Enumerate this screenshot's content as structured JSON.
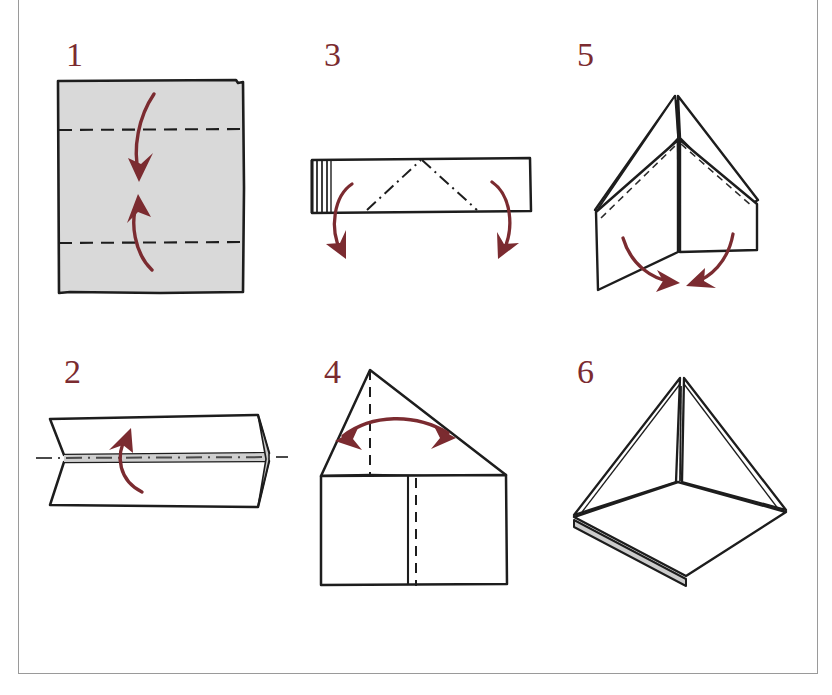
{
  "document": {
    "kind": "origami-instruction-diagram",
    "title": "Origami folding instructions",
    "step_count": 6,
    "frame_color": "#9a9a9a"
  },
  "palette": {
    "ink": "#1a1a1a",
    "arrow_red": "#7b2b30",
    "number_red": "#7b2b30",
    "paper_gray": "#d9d9d9",
    "shade_gray": "#c9c9c9",
    "page_white": "#ffffff"
  },
  "steps": [
    {
      "number": "1",
      "name": "fold-square-in-thirds",
      "shape": "square",
      "fill": "#d9d9d9",
      "crease_style": "dashed",
      "crease_count": 2,
      "arrows": [
        "curve-down",
        "curve-up"
      ],
      "description": "Gray square with two horizontal dashed crease lines at the thirds; fold top edge down and bottom edge up."
    },
    {
      "number": "2",
      "name": "fold-band-in-half",
      "shape": "horizontal-band-perspective",
      "fill": "#ffffff",
      "crease_style": "dash-dot",
      "crease_count": 1,
      "arrows": [
        "curve-up"
      ],
      "description": "Folded band seen in perspective with a dash-dot centerline; fold the lower half upward."
    },
    {
      "number": "3",
      "name": "fold-ends-down",
      "shape": "narrow-strip",
      "fill": "#ffffff",
      "crease_style": "dash-dot",
      "crease_count": 2,
      "arrows": [
        "curve-down-left",
        "curve-down-right"
      ],
      "description": "Narrow strip with layered edges at the left and an inverted-V dash-dot crease; fold both ends downward."
    },
    {
      "number": "4",
      "name": "fold-house-in-half",
      "shape": "house-triangle-on-rectangle",
      "fill": "#ffffff",
      "crease_style": "dashed",
      "crease_count": 1,
      "arrows": [
        "double-headed-arc"
      ],
      "description": "House shape (triangle over rectangle) with a vertical dashed centerline and a double-headed arrow."
    },
    {
      "number": "5",
      "name": "open-and-flatten-flaps",
      "shape": "open-tent-3d",
      "fill": "#ffffff",
      "crease_style": "dashed",
      "crease_count": 2,
      "arrows": [
        "curve-in-left",
        "curve-in-right"
      ],
      "description": "Three-dimensional open form with a peaked roof and two hanging flaps; swing both flaps inward."
    },
    {
      "number": "6",
      "name": "finished-pyramid",
      "shape": "pyramid-3d",
      "fill": "#ffffff",
      "shade": "#c9c9c9",
      "crease_style": "solid",
      "crease_count": 1,
      "arrows": [],
      "description": "Finished pyramid standing on its square base, the base edge showing layered paper shading."
    }
  ]
}
